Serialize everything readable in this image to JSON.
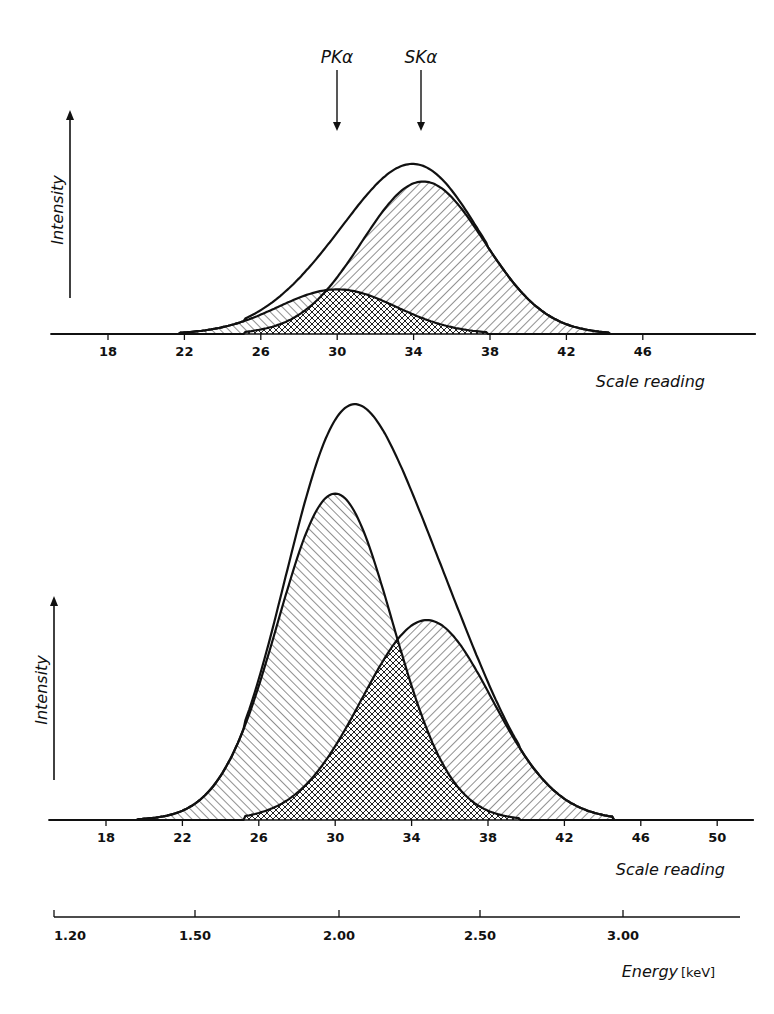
{
  "markers": [
    {
      "label": "PKα",
      "value": 30.0
    },
    {
      "label": "SKα",
      "value": 34.5
    }
  ],
  "chart_data": [
    {
      "type": "area",
      "title": "",
      "xlabel": "Scale reading",
      "ylabel": "Intensity",
      "xticks": [
        18,
        22,
        26,
        30,
        34,
        38,
        42,
        46
      ],
      "xlim": [
        15.9,
        49.6
      ],
      "grid": false,
      "series": [
        {
          "name": "PKα component",
          "hatch": "backslash",
          "center": 30.0,
          "sigma": 3.1,
          "amplitude": 0.24,
          "range": [
            21.8,
            37.8
          ]
        },
        {
          "name": "SKα component",
          "hatch": "forwardslash",
          "center": 34.5,
          "sigma": 3.2,
          "amplitude": 0.82,
          "range": [
            25.2,
            44.2
          ]
        },
        {
          "name": "Envelope (sum)",
          "hatch": "none",
          "peak_x": 33.5,
          "peak_y": 0.92
        }
      ],
      "overlap_hatch": "crosshatch"
    },
    {
      "type": "area",
      "title": "",
      "xlabel": "Scale reading",
      "ylabel": "Intensity",
      "xticks": [
        18,
        22,
        26,
        30,
        34,
        38,
        42,
        46,
        50
      ],
      "xlim": [
        15.5,
        51.1
      ],
      "grid": false,
      "series": [
        {
          "name": "PKα component",
          "hatch": "backslash",
          "center": 30.0,
          "sigma": 3.0,
          "amplitude": 0.8,
          "range": [
            19.7,
            39.6
          ]
        },
        {
          "name": "SKα component",
          "hatch": "forwardslash",
          "center": 34.8,
          "sigma": 3.4,
          "amplitude": 0.49,
          "range": [
            25.3,
            44.5
          ]
        },
        {
          "name": "Envelope (sum)",
          "hatch": "none",
          "peak_x": 31.1,
          "peak_y": 1.0
        }
      ],
      "overlap_hatch": "crosshatch"
    },
    {
      "type": "axis",
      "xlabel": "Energy",
      "unit": "[keV]",
      "xticks": [
        "1.20",
        "1.50",
        "2.00",
        "2.50",
        "3.00"
      ]
    }
  ],
  "labels": {
    "top_ylabel": "Intensity",
    "top_xlabel": "Scale reading",
    "bottom_ylabel": "Intensity",
    "bottom_xlabel": "Scale reading",
    "energy_label": "Energy",
    "energy_unit": "[keV]"
  }
}
